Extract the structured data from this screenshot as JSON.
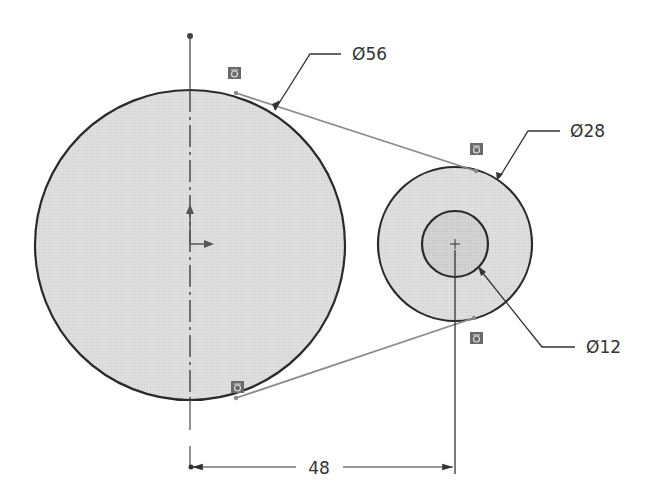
{
  "drawing": {
    "type": "sketch-pulley-belt",
    "colors": {
      "background": "#ffffff",
      "circle_fill": "#dcdcdc",
      "hub_fill": "#cfcfcf",
      "outline": "#2a2a2a",
      "tangent_line": "#8a8a8a",
      "dimension_line": "#333333",
      "relation_badge": "#666666"
    },
    "large_circle": {
      "label": "Ø56",
      "cx": 190,
      "cy": 245,
      "r": 155
    },
    "small_circle_outer": {
      "label": "Ø28",
      "cx": 455,
      "cy": 244,
      "r": 77
    },
    "small_circle_inner": {
      "label": "Ø12",
      "cx": 455,
      "cy": 244,
      "r": 33
    },
    "dimensions": {
      "diameter_large": "Ø56",
      "diameter_small": "Ø28",
      "diameter_hole": "Ø12",
      "center_distance": "48"
    },
    "relations": [
      {
        "name": "tangent-relation-top-left",
        "x": 228,
        "y": 67
      },
      {
        "name": "tangent-relation-top-right",
        "x": 470,
        "y": 143
      },
      {
        "name": "tangent-relation-bottom-right",
        "x": 470,
        "y": 332
      },
      {
        "name": "tangent-relation-bottom-left",
        "x": 231,
        "y": 381
      }
    ]
  }
}
